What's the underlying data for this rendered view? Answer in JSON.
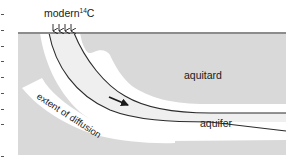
{
  "diagram": {
    "title_label": "modern",
    "isotope_superscript": "14",
    "isotope_symbol": "C",
    "layers": {
      "aquitard_label": "aquitard",
      "aquifer_label": "aquifer",
      "diffusion_label": "extent of diffusion"
    },
    "recharge_arrows_count": 4,
    "flow_direction": "down-right along aquifer",
    "colors": {
      "aquitard_fill": "#d9d9d9",
      "ground_surface_line": "#8c8c8c",
      "diffusion_fill": "#ffffff",
      "aquifer_fill": "#f0f0f0",
      "boundary_stroke": "#2b2b2b",
      "text": "#1a1a1a"
    }
  }
}
